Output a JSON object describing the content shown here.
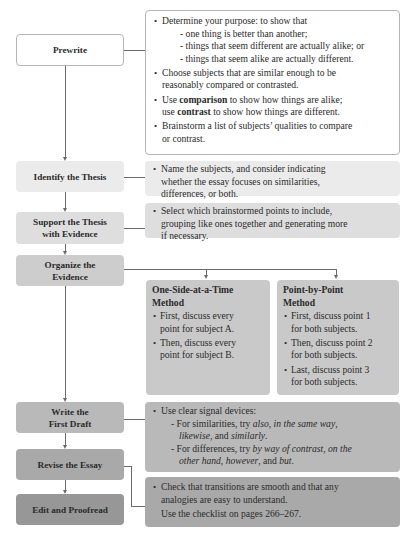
{
  "colors": {
    "prewrite_bg": "#ffffff",
    "prewrite_border": "#b5b5b5",
    "identify_bg": "#ebebeb",
    "support_bg": "#dedede",
    "organize_bg": "#cdcdcd",
    "methods_bg": "#c9c9c9",
    "write_bg": "#b9b9b9",
    "revise_bg": "#a9a9a9",
    "edit_bg": "#979797",
    "connector": "#6a6a6a"
  },
  "steps": [
    {
      "id": "prewrite",
      "label": "Prewrite"
    },
    {
      "id": "identify",
      "label": "Identify the Thesis"
    },
    {
      "id": "support",
      "label_line1": "Support the Thesis",
      "label_line2": "with Evidence"
    },
    {
      "id": "organize",
      "label_line1": "Organize the",
      "label_line2": "Evidence"
    },
    {
      "id": "write",
      "label_line1": "Write the",
      "label_line2": "First Draft"
    },
    {
      "id": "revise",
      "label": "Revise the Essay"
    },
    {
      "id": "edit",
      "label": "Edit and Proofread"
    }
  ],
  "notes": {
    "prewrite": {
      "b1": "Determine your purpose: to show that",
      "b1_subs": [
        "- one thing is better than another;",
        "- things that seem different are actually alike; or",
        "- things that seem alike are actually different."
      ],
      "b2_line1": "Choose subjects that are similar enough to be",
      "b2_line2": "reasonably compared or contrasted.",
      "b3_pre": "Use ",
      "b3_bold1": "comparison",
      "b3_mid": " to show how things are alike;",
      "b3_line2_pre": "use ",
      "b3_bold2": "contrast",
      "b3_line2_post": " to show how things are different.",
      "b4_line1": "Brainstorm a list of subjects’ qualities to compare",
      "b4_line2": "or contrast."
    },
    "identify": {
      "b1_line1": "Name the subjects, and consider indicating",
      "b1_line2": "whether the essay focuses on similarities,",
      "b1_line3": "differences, or both."
    },
    "support": {
      "b1_line1": "Select which brainstormed points to include,",
      "b1_line2": "grouping like ones together and generating more",
      "b1_line3": "if necessary."
    },
    "write": {
      "b1": "Use clear signal devices:",
      "sim_pre": "- For similarities, try ",
      "sim_i1": "also",
      "sim_c1": ", ",
      "sim_i2": "in the same way",
      "sim_c2": ",",
      "sim_i3": "likewise",
      "sim_c3": ", and ",
      "sim_i4": "similarly",
      "sim_end": ".",
      "diff_pre": "- For differences, try ",
      "diff_i1": "by way of contrast",
      "diff_c1": ", ",
      "diff_i2": "on the",
      "diff_i2b": "other hand",
      "diff_c2": ", ",
      "diff_i3": "however",
      "diff_c3": ", and ",
      "diff_i4": "but",
      "diff_end": "."
    },
    "edit": {
      "b1_line1": "Check that transitions are smooth and that any",
      "b1_line2": "analogies are easy to understand.",
      "checklist": "Use the checklist on pages 266–267."
    }
  },
  "methods": [
    {
      "title_line1": "One-Side-at-a-Time",
      "title_line2": "Method",
      "items": [
        {
          "line1": "First, discuss every",
          "line2": "point for subject A."
        },
        {
          "line1": "Then, discuss every",
          "line2": "point for subject B."
        }
      ]
    },
    {
      "title_line1": "Point-by-Point",
      "title_line2": "Method",
      "items": [
        {
          "line1": "First, discuss point 1",
          "line2": "for both subjects."
        },
        {
          "line1": "Then, discuss point 2",
          "line2": "for both subjects."
        },
        {
          "line1": "Last, discuss point 3",
          "line2": "for both subjects."
        }
      ]
    }
  ]
}
